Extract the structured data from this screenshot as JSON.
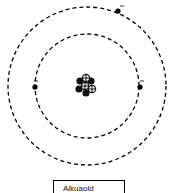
{
  "diagram": {
    "type": "atom-bohr-model",
    "orbits": [
      {
        "name": "inner-shell",
        "cx": 87,
        "cy": 86,
        "r": 52
      },
      {
        "name": "outer-shell",
        "cx": 87,
        "cy": 86,
        "r": 79
      }
    ],
    "electrons": [
      {
        "shell": 1,
        "x": 35,
        "y": 87,
        "charge": "-"
      },
      {
        "shell": 1,
        "x": 140,
        "y": 87,
        "charge": "-"
      },
      {
        "shell": 2,
        "x": 118,
        "y": 11,
        "charge": "-"
      }
    ],
    "nucleus": {
      "protons": 3,
      "neutrons": 4
    },
    "label": "Alkuaold",
    "colors": {
      "line": "#000000",
      "background": "#ffffff"
    }
  }
}
